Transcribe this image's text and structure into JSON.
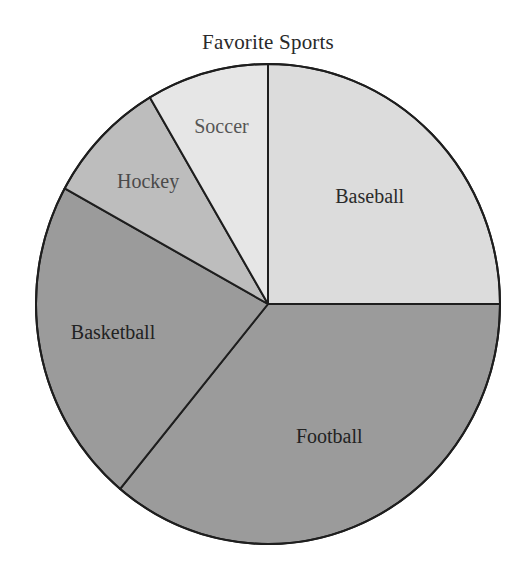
{
  "chart_data": {
    "type": "pie",
    "title": "Favorite Sports",
    "categories": [
      "Baseball",
      "Football",
      "Basketball",
      "Hockey",
      "Soccer"
    ],
    "values": [
      25,
      36,
      22,
      8.5,
      8.5
    ],
    "unit": "percent (estimated from slice angles; no values shown)",
    "start_angle": "12 o'clock, Baseball drawn clockwise from top",
    "slices": [
      {
        "label": "Baseball",
        "value": 25,
        "color": "#dcdcdc",
        "label_color": "#2a2a2a"
      },
      {
        "label": "Football",
        "value": 36,
        "color": "#9b9b9b",
        "label_color": "#222222"
      },
      {
        "label": "Basketball",
        "value": 22,
        "color": "#9b9b9b",
        "label_color": "#222222"
      },
      {
        "label": "Hockey",
        "value": 8.5,
        "color": "#bdbdbd",
        "label_color": "#4a4a4a"
      },
      {
        "label": "Soccer",
        "value": 8.5,
        "color": "#e6e6e6",
        "label_color": "#555555"
      }
    ],
    "legend": "none (labels inside slices)",
    "grid": false
  }
}
